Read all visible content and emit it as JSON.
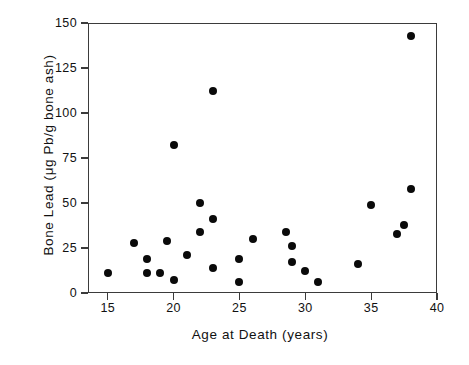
{
  "chart_data": {
    "type": "scatter",
    "title": "",
    "xlabel": "Age at Death   (years)",
    "ylabel": "Bone Lead  (μg Pb/g bone ash)",
    "xlim": [
      13.5,
      40
    ],
    "ylim": [
      0,
      150
    ],
    "xticks": [
      15,
      20,
      25,
      30,
      35,
      40
    ],
    "yticks": [
      0,
      25,
      50,
      75,
      100,
      125,
      150
    ],
    "xtick_labels": [
      "15",
      "20",
      "25",
      "30",
      "35",
      "40"
    ],
    "ytick_labels": [
      "0",
      "25",
      "50",
      "75",
      "100",
      "125",
      "150"
    ],
    "grid": false,
    "legend": null,
    "marker": "filled-circle",
    "marker_color": "#0a0a0a",
    "n_points": 30,
    "points": [
      {
        "x": 15.0,
        "y": 11
      },
      {
        "x": 17.0,
        "y": 28
      },
      {
        "x": 18.0,
        "y": 19
      },
      {
        "x": 18.0,
        "y": 11
      },
      {
        "x": 19.0,
        "y": 11
      },
      {
        "x": 19.5,
        "y": 29
      },
      {
        "x": 20.0,
        "y": 7
      },
      {
        "x": 20.0,
        "y": 82
      },
      {
        "x": 21.0,
        "y": 21
      },
      {
        "x": 22.0,
        "y": 34
      },
      {
        "x": 22.0,
        "y": 50
      },
      {
        "x": 23.0,
        "y": 112
      },
      {
        "x": 23.0,
        "y": 41
      },
      {
        "x": 23.0,
        "y": 14
      },
      {
        "x": 25.0,
        "y": 19
      },
      {
        "x": 25.0,
        "y": 6
      },
      {
        "x": 26.0,
        "y": 30
      },
      {
        "x": 28.5,
        "y": 34
      },
      {
        "x": 29.0,
        "y": 26
      },
      {
        "x": 29.0,
        "y": 17
      },
      {
        "x": 30.0,
        "y": 12
      },
      {
        "x": 31.0,
        "y": 6
      },
      {
        "x": 34.0,
        "y": 16
      },
      {
        "x": 35.0,
        "y": 49
      },
      {
        "x": 37.0,
        "y": 33
      },
      {
        "x": 37.5,
        "y": 38
      },
      {
        "x": 38.0,
        "y": 58
      },
      {
        "x": 38.0,
        "y": 143
      }
    ]
  },
  "axes": {
    "frame_color": "#3b3b3b",
    "background": "#ffffff"
  }
}
